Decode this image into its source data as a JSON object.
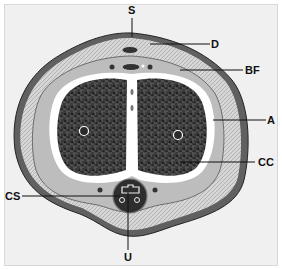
{
  "figure": {
    "type": "anatomical cross-section",
    "labels": [
      {
        "id": "S",
        "text": "S"
      },
      {
        "id": "D",
        "text": "D"
      },
      {
        "id": "BF",
        "text": "BF"
      },
      {
        "id": "A",
        "text": "A"
      },
      {
        "id": "CC",
        "text": "CC"
      },
      {
        "id": "CS",
        "text": "CS"
      },
      {
        "id": "U",
        "text": "U"
      }
    ]
  },
  "colors": {
    "background": "#f0f0f0",
    "skin": "#6a6a6a",
    "fascia": "#d2d2d2",
    "tissue_dark": "#2e2e2e",
    "tunica": "#ffffff",
    "line": "#111111"
  }
}
